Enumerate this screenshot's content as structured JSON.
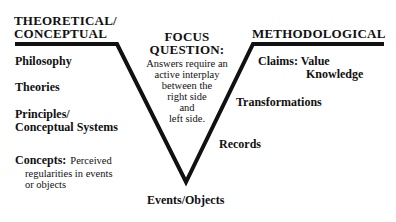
{
  "diagram": {
    "type": "knowledge-vee",
    "left": {
      "heading": [
        "THEORETICAL/",
        "CONCEPTUAL"
      ],
      "items": [
        {
          "label": "Philosophy"
        },
        {
          "label": "Theories"
        },
        {
          "label_lines": [
            "Principles/",
            "Conceptual Systems"
          ]
        },
        {
          "label": "Concepts:",
          "detail_lines": [
            "Perceived",
            "regularities in events",
            "or objects"
          ]
        }
      ]
    },
    "center": {
      "heading": [
        "FOCUS",
        "QUESTION:"
      ],
      "body": [
        "Answers require an",
        "active interplay",
        "between the",
        "right side",
        "and",
        "left side."
      ]
    },
    "right": {
      "heading": "METHODOLOGICAL",
      "items": [
        {
          "label": "Claims:",
          "detail_lines": [
            "Value",
            "Knowledge"
          ]
        },
        {
          "label": "Transformations"
        },
        {
          "label": "Records"
        }
      ]
    },
    "bottom": {
      "label": "Events/Objects"
    },
    "colors": {
      "line": "#111111",
      "text": "#111111",
      "background": "#ffffff"
    }
  }
}
